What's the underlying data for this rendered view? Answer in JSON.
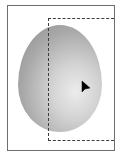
{
  "canvas": {
    "frame_color": "#6e6e6e",
    "selection_border_color": "#3c3c3c",
    "shape": {
      "type": "egg-ellipse",
      "fill": "gradient-gray",
      "highlight_color": "#ececec",
      "shadow_color": "#8c8c8c"
    },
    "selection": {
      "style": "dashed-marquee"
    },
    "cursor": {
      "icon": "arrow-pointer-icon",
      "color": "#000000"
    }
  }
}
